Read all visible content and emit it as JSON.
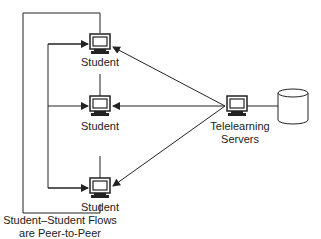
{
  "diagram": {
    "nodes": {
      "student_top": {
        "label": "Student"
      },
      "student_mid": {
        "label": "Student"
      },
      "student_bot": {
        "label": "Student"
      },
      "server": {
        "label_line1": "Telelearning",
        "label_line2": "Servers"
      },
      "database": {
        "label": ""
      }
    },
    "caption": {
      "line1": "Student–Student Flows",
      "line2": "are Peer-to-Peer"
    },
    "colors": {
      "line": "#222222",
      "background": "#ffffff"
    }
  }
}
